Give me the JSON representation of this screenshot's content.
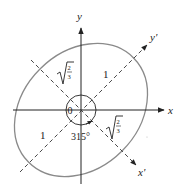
{
  "diagram": {
    "type": "rotated-ellipse-axes",
    "colors": {
      "axis": "#222222",
      "ellipse": "#8a8a8a",
      "dashed": "#333333",
      "background": "#ffffff"
    },
    "axes": {
      "x_label": "x",
      "y_label": "y",
      "x_prime_label": "x'",
      "y_prime_label": "y'"
    },
    "semi_axes": {
      "upper_left": {
        "label": "√(2/3)",
        "numerator": "2",
        "denominator": "3"
      },
      "upper_right": {
        "label": "1"
      },
      "lower_left": {
        "label": "1"
      },
      "lower_right": {
        "label": "√(2/3)",
        "numerator": "2",
        "denominator": "3"
      }
    },
    "angles": {
      "origin_angle": "0",
      "rotation_angle": "315°"
    }
  }
}
